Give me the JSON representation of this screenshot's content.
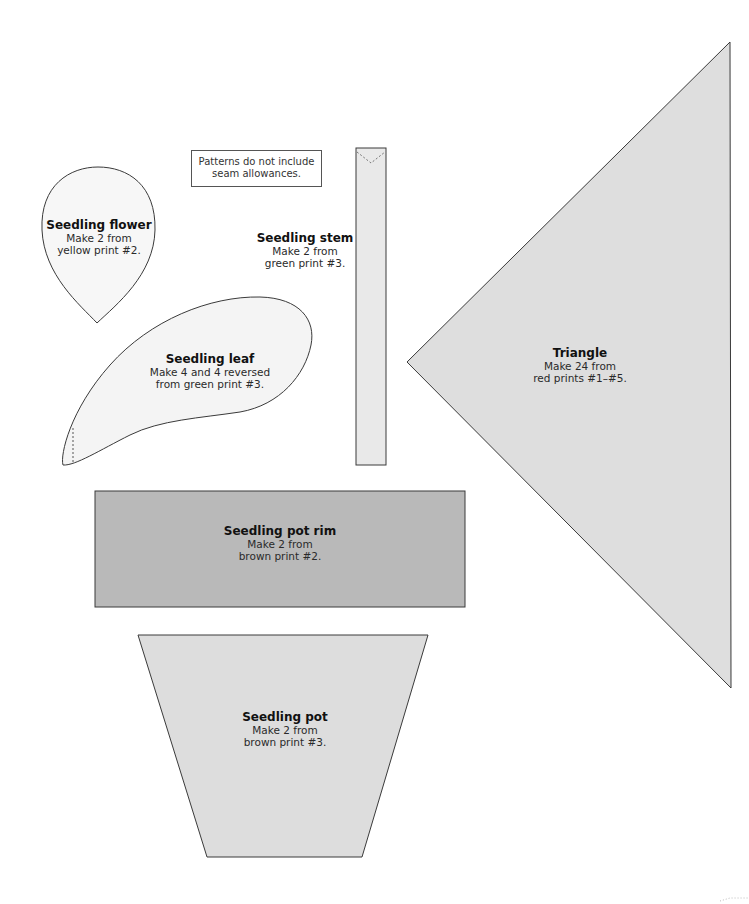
{
  "note": {
    "line1": "Patterns do not include",
    "line2": "seam allowances."
  },
  "colors": {
    "outline": "#3a3a3a",
    "flower_fill": "#f7f7f7",
    "leaf_fill": "#f4f4f4",
    "stem_fill": "#e9e9e9",
    "triangle_fill": "#dedede",
    "pot_rim_fill": "#b9b9b9",
    "pot_fill": "#dddddd"
  },
  "pieces": {
    "flower": {
      "title": "Seedling flower",
      "line1": "Make 2 from",
      "line2": "yellow print #2."
    },
    "stem": {
      "title": "Seedling stem",
      "line1": "Make 2 from",
      "line2": "green print #3."
    },
    "leaf": {
      "title": "Seedling leaf",
      "line1": "Make 4 and 4 reversed",
      "line2": "from green print #3."
    },
    "triangle": {
      "title": "Triangle",
      "line1": "Make 24 from",
      "line2": "red prints #1–#5."
    },
    "pot_rim": {
      "title": "Seedling pot rim",
      "line1": "Make 2 from",
      "line2": "brown print #2."
    },
    "pot": {
      "title": "Seedling pot",
      "line1": "Make 2 from",
      "line2": "brown print #3."
    }
  }
}
